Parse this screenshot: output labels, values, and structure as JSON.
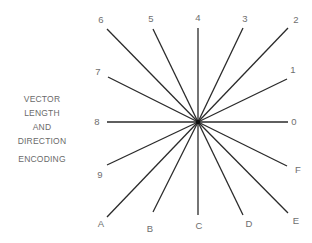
{
  "caption": {
    "lines": [
      "VECTOR",
      "LENGTH",
      "AND",
      "DIRECTION"
    ],
    "last_line": "ENCODING"
  },
  "diagram": {
    "type": "vector-direction-star",
    "line_color": "#2a2a2a",
    "label_color": "#6e6e6e",
    "vectors": [
      {
        "label": "0",
        "direction": "east"
      },
      {
        "label": "1",
        "direction": "east-northeast"
      },
      {
        "label": "2",
        "direction": "northeast"
      },
      {
        "label": "3",
        "direction": "north-northeast"
      },
      {
        "label": "4",
        "direction": "north"
      },
      {
        "label": "5",
        "direction": "north-northwest"
      },
      {
        "label": "6",
        "direction": "northwest"
      },
      {
        "label": "7",
        "direction": "west-northwest"
      },
      {
        "label": "8",
        "direction": "west"
      },
      {
        "label": "9",
        "direction": "west-southwest"
      },
      {
        "label": "A",
        "direction": "southwest"
      },
      {
        "label": "B",
        "direction": "south-southwest"
      },
      {
        "label": "C",
        "direction": "south"
      },
      {
        "label": "D",
        "direction": "south-southeast"
      },
      {
        "label": "E",
        "direction": "southeast"
      },
      {
        "label": "F",
        "direction": "east-southeast"
      }
    ]
  }
}
